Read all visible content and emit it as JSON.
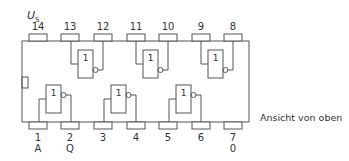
{
  "diagram": {
    "supply_label": "U",
    "supply_subscript": "S",
    "view_note": "Ansicht von oben",
    "top_pins": [
      {
        "number": "14",
        "x": 29
      },
      {
        "number": "13",
        "x": 61
      },
      {
        "number": "12",
        "x": 94
      },
      {
        "number": "11",
        "x": 127
      },
      {
        "number": "10",
        "x": 159
      },
      {
        "number": "9",
        "x": 192
      },
      {
        "number": "8",
        "x": 224
      }
    ],
    "bottom_pins": [
      {
        "number": "1",
        "signal": "A",
        "x": 29
      },
      {
        "number": "2",
        "signal": "Q",
        "x": 61
      },
      {
        "number": "3",
        "signal": "",
        "x": 94
      },
      {
        "number": "4",
        "signal": "",
        "x": 127
      },
      {
        "number": "5",
        "signal": "",
        "x": 159
      },
      {
        "number": "6",
        "signal": "",
        "x": 192
      },
      {
        "number": "7",
        "signal": "0",
        "x": 224
      }
    ],
    "gates": [
      {
        "label": "1",
        "row": "top",
        "input_pin": "13",
        "output_pin": "12"
      },
      {
        "label": "1",
        "row": "top",
        "input_pin": "11",
        "output_pin": "10"
      },
      {
        "label": "1",
        "row": "top",
        "input_pin": "9",
        "output_pin": "8"
      },
      {
        "label": "1",
        "row": "bottom",
        "input_pin": "1",
        "output_pin": "2"
      },
      {
        "label": "1",
        "row": "bottom",
        "input_pin": "3",
        "output_pin": "4"
      },
      {
        "label": "1",
        "row": "bottom",
        "input_pin": "5",
        "output_pin": "6"
      }
    ]
  }
}
